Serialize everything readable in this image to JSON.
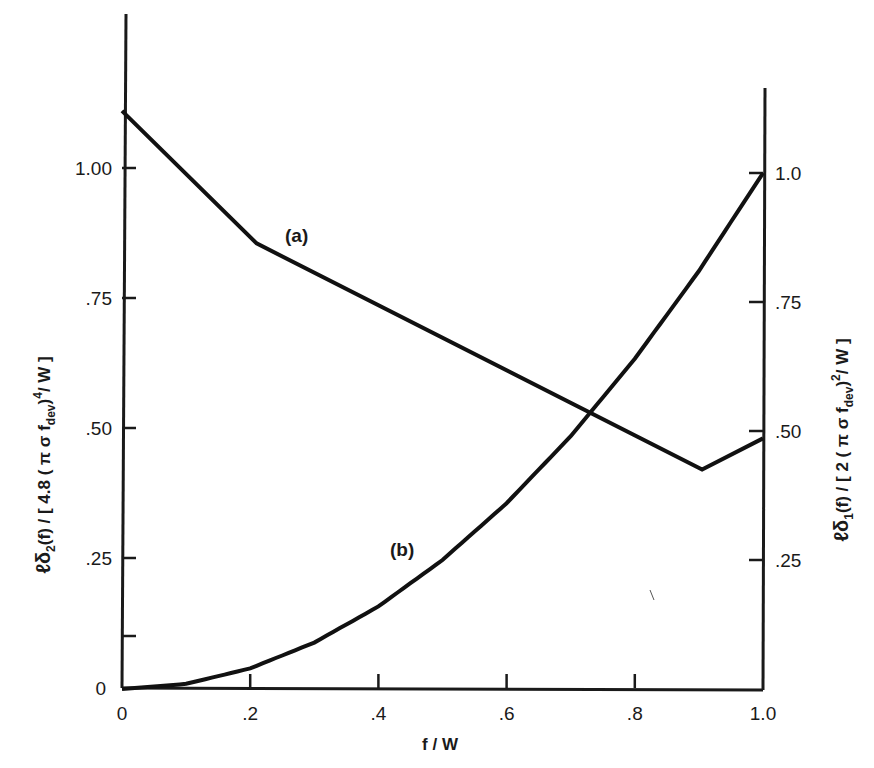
{
  "chart_data": {
    "type": "line",
    "title": "",
    "xlabel": "f / W",
    "ylabel_left": "ℓδ₂(f) / [4.8(πσf_dev)⁴/W]",
    "ylabel_right": "ℓδ₁(f) / [2(πσf_dev)²/W]",
    "xlim": [
      0,
      1.0
    ],
    "ylim_left": [
      0,
      1.2
    ],
    "ylim_right": [
      0,
      1.2
    ],
    "grid": false,
    "legend": "inline labels",
    "x_ticks": [
      "0",
      ".2",
      ".4",
      ".6",
      ".8",
      "1.0"
    ],
    "x_tick_values": [
      0,
      0.2,
      0.4,
      0.6,
      0.8,
      1.0
    ],
    "y_ticks_left": [
      "0",
      ".25",
      ".50",
      ".75",
      "1.00"
    ],
    "y_tick_values_left": [
      0,
      0.25,
      0.5,
      0.75,
      1.0
    ],
    "y_minor_tick_left": 0.1,
    "y_ticks_right": [
      ".25",
      ".50",
      ".75",
      "1.0"
    ],
    "y_tick_values_right": [
      0.25,
      0.5,
      0.75,
      1.0
    ],
    "series": [
      {
        "name": "(a)",
        "axis": "left",
        "x": [
          0.0,
          0.21,
          0.905,
          1.0
        ],
        "y": [
          1.11,
          0.855,
          0.42,
          0.48
        ]
      },
      {
        "name": "(b)",
        "axis": "right",
        "x": [
          0.0,
          0.1,
          0.2,
          0.3,
          0.4,
          0.5,
          0.6,
          0.7,
          0.8,
          0.9,
          1.0
        ],
        "y": [
          0.0,
          0.01,
          0.04,
          0.09,
          0.16,
          0.25,
          0.36,
          0.49,
          0.64,
          0.81,
          1.0
        ]
      }
    ],
    "annotations": [
      {
        "text": "(a)",
        "x": 0.28,
        "y_left": 0.86
      },
      {
        "text": "(b)",
        "x": 0.42,
        "y_right": 0.28
      }
    ]
  },
  "labels": {
    "xlabel": "f / W",
    "curve_a": "(a)",
    "curve_b": "(b)",
    "left_title_main": "ℓδ",
    "left_title_sub": "2",
    "left_title_rest": "(f) / [ 4.8 ( π σ f",
    "left_title_dev": "dev",
    "left_title_end": ")",
    "left_title_sup": "4",
    "left_title_tail": "/ W ]",
    "right_title_main": "ℓδ",
    "right_title_sub": "1",
    "right_title_rest": "(f) / [ 2 ( π σ f",
    "right_title_dev": "dev",
    "right_title_end": ")",
    "right_title_sup": "2",
    "right_title_tail": "/ W ]"
  }
}
